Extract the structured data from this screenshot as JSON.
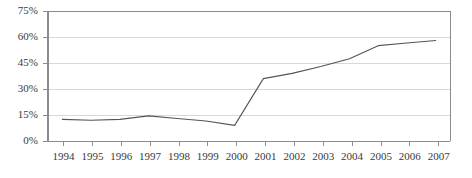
{
  "chart_data": {
    "type": "line",
    "title": "",
    "subtitle": "",
    "xlabel": "",
    "ylabel": "",
    "categories": [
      "1994",
      "1995",
      "1996",
      "1997",
      "1998",
      "1999",
      "2000",
      "2001",
      "2002",
      "2003",
      "2004",
      "2005",
      "2006",
      "2007"
    ],
    "x": [
      1994,
      1995,
      1996,
      1997,
      1998,
      1999,
      2000,
      2001,
      2002,
      2003,
      2004,
      2005,
      2006,
      2007
    ],
    "values": [
      12.5,
      12.0,
      12.5,
      14.5,
      13.0,
      11.5,
      9.0,
      36.0,
      39.0,
      43.0,
      47.5,
      55.0,
      56.5,
      58.0
    ],
    "series": [
      {
        "name": "",
        "values": [
          12.5,
          12.0,
          12.5,
          14.5,
          13.0,
          11.5,
          9.0,
          36.0,
          39.0,
          43.0,
          47.5,
          55.0,
          56.5,
          58.0
        ],
        "color": "#555555"
      }
    ],
    "ylim": [
      0,
      75
    ],
    "yticks": [
      0,
      15,
      30,
      45,
      60,
      75
    ],
    "ytick_labels": [
      "0%",
      "15%",
      "30%",
      "45%",
      "60%",
      "75%"
    ],
    "xlim": [
      1994,
      2007
    ],
    "grid": true,
    "grid_axis": "y",
    "legend": false,
    "legend_position": "none"
  },
  "style": {
    "background": "#ffffff",
    "line_color": "#555555",
    "grid_color": "#d8d8d8",
    "top_border_color": "#8c8c8c",
    "axis_color": "#8c8c8c",
    "tick_color": "#8c8c8c",
    "text_color": "#3a3a3a"
  },
  "geometry": {
    "plot_left": 48,
    "plot_right": 450,
    "plot_top": 11,
    "plot_bottom": 141
  }
}
